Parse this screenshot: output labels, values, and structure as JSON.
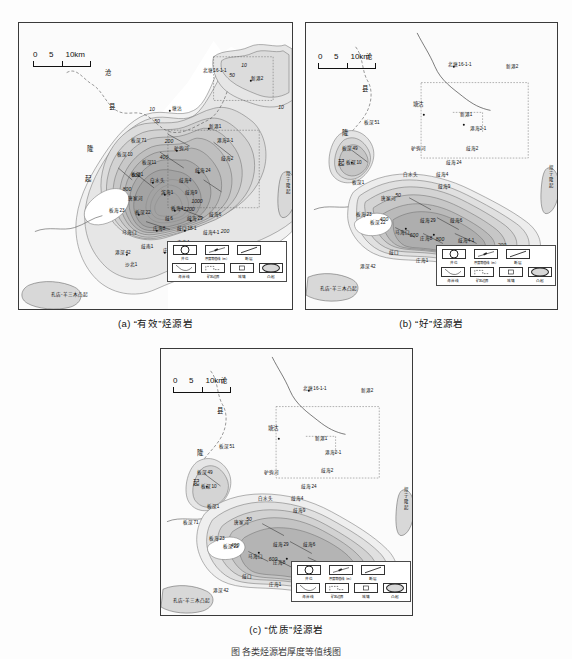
{
  "figure": {
    "caption": "图  各类烃源岩厚度等值线图",
    "scalebar": {
      "ticks": [
        "0",
        "5",
        "10km"
      ],
      "unit": "km"
    }
  },
  "panels": [
    {
      "id": "a",
      "caption": "(a)  “有效”烃源岩",
      "structures": {
        "left_uplift": "沧县隆起",
        "left_uplift_chars": [
          "沧",
          "县",
          "隆",
          "起"
        ],
        "bottom_left_uplift": "孔店-羊三木凸起",
        "right_uplift": "埕宁隆起"
      },
      "contours": [
        "10",
        "50",
        "200",
        "400",
        "600",
        "800",
        "1000",
        "1200"
      ],
      "wells": [
        "塘沽",
        "板深51",
        "板海2",
        "新港1",
        "新港2",
        "北塘16-1-1",
        "港海2-1",
        "驴驹河",
        "歧海2",
        "歧海24",
        "白水头",
        "歧海4",
        "歧海9",
        "板深71",
        "板深49",
        "板深10",
        "板深11",
        "板深1",
        "滨海1",
        "唐家河",
        "板海23",
        "板深22",
        "板海4",
        "歧海29",
        "歧海6",
        "马海口",
        "庄海8",
        "歧口18-1",
        "歧海4-1",
        "歧6",
        "歧南1",
        "港深42",
        "庄海1",
        "赵家堡",
        "庄海4",
        "沙北1"
      ]
    },
    {
      "id": "b",
      "caption": "(b)  “好”烃源岩",
      "structures": {
        "left_uplift_chars": [
          "沧",
          "县",
          "隆",
          "起"
        ],
        "bottom_left_uplift": "孔店-羊三木凸起",
        "right_uplift": "埕宁隆起"
      },
      "contours": [
        "50",
        "200",
        "400",
        "600",
        "800"
      ],
      "wells": [
        "塘沽",
        "北塘16-1-1",
        "新港2",
        "新港1",
        "港海2-1",
        "板深51",
        "驴驹河",
        "歧海2",
        "歧海24",
        "白水头",
        "歧海4",
        "歧海9",
        "板深49",
        "板深10",
        "板深1",
        "唐家河",
        "板海23",
        "板深22",
        "歧海29",
        "歧海6",
        "马海口",
        "庄海8",
        "歧海4-1",
        "歧口",
        "庄海1",
        "赵家堡",
        "港深42",
        "歧南1"
      ]
    },
    {
      "id": "c",
      "caption": "(c)  “优质”烃源岩",
      "structures": {
        "left_uplift_chars": [
          "沧",
          "县",
          "隆",
          "起"
        ],
        "bottom_left_uplift": "孔店-羊三木凸起",
        "right_uplift": "埕宁隆起"
      },
      "contours": [
        "50",
        "200",
        "400",
        "600"
      ],
      "wells": [
        "塘沽",
        "北塘16-1-1",
        "新港2",
        "新港1",
        "港海2-1",
        "板深51",
        "驴驹河",
        "歧海2",
        "歧海24",
        "白水头",
        "歧海4",
        "歧海9",
        "板深49",
        "板深10",
        "板深1",
        "唐家河",
        "板海23",
        "板深22",
        "歧海29",
        "歧海6",
        "马海口",
        "庄海8",
        "歧海4-1",
        "歧口",
        "庄海1",
        "赵家堡",
        "港深42",
        "歧南1",
        "板深71"
      ]
    }
  ],
  "legend": {
    "row1": [
      {
        "icon": "well-symbol-icon",
        "label": "井位"
      },
      {
        "icon": "thickness-contour-icon",
        "label": "厚度等值线（m）"
      },
      {
        "icon": "fault-icon",
        "label": "断层"
      }
    ],
    "row2": [
      {
        "icon": "coastline-icon",
        "label": "海岸线"
      },
      {
        "icon": "mining-boundary-icon",
        "label": "矿区边界"
      },
      {
        "icon": "town-icon",
        "label": "城镇"
      },
      {
        "icon": "uplift-icon",
        "label": "凸起"
      }
    ]
  },
  "colors": {
    "frame": "#3a3a3a",
    "fill_lightest": "#f0f0f0",
    "fill_light": "#e2e2e2",
    "fill_mid": "#cfcfcf",
    "fill_dark": "#b8b8b8",
    "fill_darkest": "#a3a3a3",
    "contour_line": "#5a5a5a",
    "coastline": "#444444",
    "text": "#111111",
    "background": "#fdfdfd"
  }
}
